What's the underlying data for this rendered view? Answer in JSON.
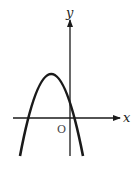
{
  "diagram": {
    "type": "graph-of-function",
    "axes": {
      "x_label": "x",
      "y_label": "y",
      "origin_label": "O"
    },
    "curve": {
      "shape": "parabola",
      "opens": "down",
      "vertex_quadrant": "II",
      "y_intercept_sign": "positive",
      "x_intercepts": [
        "negative",
        "positive"
      ]
    },
    "colors": {
      "stroke": "#1a1a1a",
      "background": "#ffffff"
    }
  }
}
